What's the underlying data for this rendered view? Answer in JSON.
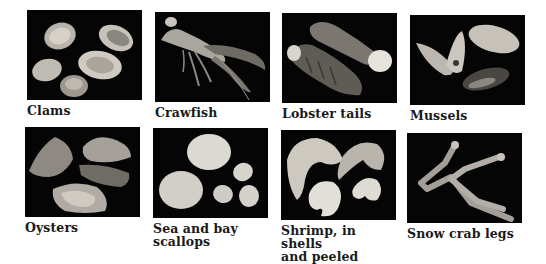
{
  "items": [
    {
      "id": "clams",
      "caption": "Clams",
      "icon": "clams-photo"
    },
    {
      "id": "crawfish",
      "caption": "Crawfish",
      "icon": "crawfish-photo"
    },
    {
      "id": "lobster-tails",
      "caption": "Lobster tails",
      "icon": "lobster-tails-photo"
    },
    {
      "id": "mussels",
      "caption": "Mussels",
      "icon": "mussels-photo"
    },
    {
      "id": "oysters",
      "caption": "Oysters",
      "icon": "oysters-photo"
    },
    {
      "id": "scallops",
      "caption_line1": "Sea and bay",
      "caption_line2": "scallops",
      "icon": "scallops-photo"
    },
    {
      "id": "shrimp",
      "caption_line1": "Shrimp, in shells",
      "caption_line2": "and peeled",
      "icon": "shrimp-photo"
    },
    {
      "id": "snow-crab-legs",
      "caption": "Snow crab legs",
      "icon": "snow-crab-legs-photo"
    }
  ],
  "colors": {
    "photo_background": "#050505",
    "caption_text": "#1a1a1a",
    "page_background": "#ffffff"
  }
}
